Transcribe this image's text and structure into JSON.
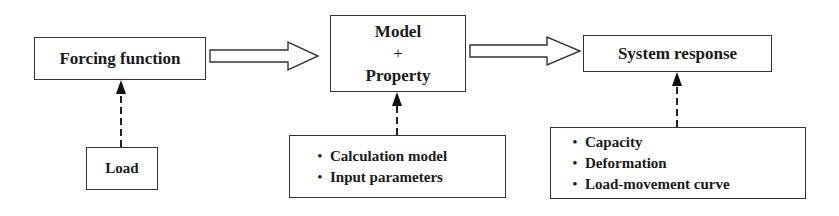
{
  "diagram": {
    "nodes": {
      "forcing_function": {
        "label": "Forcing function"
      },
      "model_property": {
        "line1": "Model",
        "line2": "+",
        "line3": "Property"
      },
      "system_response": {
        "label": "System response"
      },
      "load": {
        "label": "Load"
      },
      "calculation": {
        "items": [
          "Calculation model",
          "Input parameters"
        ]
      },
      "response_outputs": {
        "items": [
          "Capacity",
          "Deformation",
          "Load-movement curve"
        ]
      }
    },
    "edges": [
      {
        "from": "forcing_function",
        "to": "model_property",
        "style": "hollow-block-arrow"
      },
      {
        "from": "model_property",
        "to": "system_response",
        "style": "hollow-block-arrow"
      },
      {
        "from": "load",
        "to": "forcing_function",
        "style": "dashed-arrow"
      },
      {
        "from": "calculation",
        "to": "model_property",
        "style": "dashed-arrow"
      },
      {
        "from": "response_outputs",
        "to": "system_response",
        "style": "dashed-arrow"
      }
    ]
  }
}
